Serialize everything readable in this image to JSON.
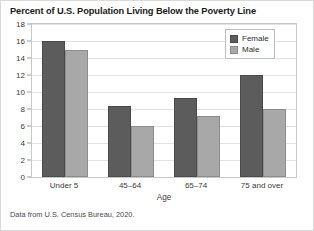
{
  "chart_data": {
    "type": "bar",
    "title": "Percent of U.S. Population Living Below the Poverty Line",
    "xlabel": "Age",
    "ylabel": "",
    "categories": [
      "Under 5",
      "45–64",
      "65–74",
      "75 and over"
    ],
    "series": [
      {
        "name": "Female",
        "color": "#5c5c5c",
        "values": [
          16,
          8.3,
          9.3,
          12
        ]
      },
      {
        "name": "Male",
        "color": "#a8a8a8",
        "values": [
          14.9,
          6,
          7.2,
          8
        ]
      }
    ],
    "ylim": [
      0,
      18
    ],
    "ytick_step": 2,
    "yticks": [
      18,
      16,
      14,
      12,
      10,
      8,
      6,
      4,
      2,
      0
    ],
    "grid": true,
    "legend_position": "top-right",
    "source_note": "Data from U.S. Census Bureau, 2020."
  }
}
